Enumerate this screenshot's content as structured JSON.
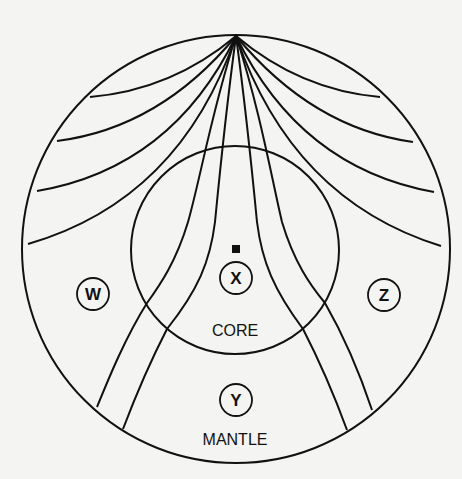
{
  "diagram": {
    "colors": {
      "ink": "#111111",
      "background": "#f4f4f2"
    },
    "layers": {
      "core": {
        "label": "CORE"
      },
      "mantle": {
        "label": "MANTLE"
      }
    },
    "source_marker": {
      "shape": "square"
    },
    "points": [
      {
        "id": "W",
        "label": "W"
      },
      {
        "id": "X",
        "label": "X"
      },
      {
        "id": "Y",
        "label": "Y"
      },
      {
        "id": "Z",
        "label": "Z"
      }
    ],
    "wave_paths": {
      "origin": "top of Earth",
      "mantle_only_paths_per_side": 4,
      "core_crossing_paths_per_side": 2
    }
  }
}
